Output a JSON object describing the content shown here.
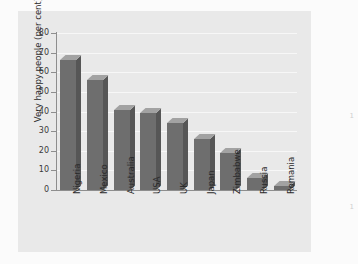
{
  "chart_data": {
    "type": "bar",
    "title": "",
    "subtitle": "",
    "xlabel": "",
    "ylabel": "Very happy people (per cent)",
    "categories": [
      "Nigeria",
      "Mexico",
      "Australia",
      "USA",
      "UK",
      "Japan",
      "Zimbabwe",
      "Russia",
      "Romania"
    ],
    "values": [
      66,
      56,
      41,
      39,
      34,
      26,
      19,
      6,
      2
    ],
    "ylim": [
      0,
      80
    ],
    "ytick_labels": [
      "80",
      "70",
      "60",
      "50",
      "40",
      "30",
      "20",
      "10",
      "0"
    ],
    "ytick_values": [
      80,
      70,
      60,
      50,
      40,
      30,
      20,
      10,
      0
    ],
    "grid": true,
    "legend": "none",
    "orientation": "vertical",
    "bar_style": "3d",
    "colors": {
      "bar_front": "#6e6e6e",
      "bar_top": "#a2a2a2",
      "bar_side": "#565656",
      "panel_background": "#e9e9e9",
      "gridline": "#f7f7f7",
      "axis": "#8e8e8e",
      "text": "#2b2b2b",
      "page_background": "#fbfbfb"
    }
  },
  "page_margin_marks": {
    "top": "1",
    "bottom": "1"
  }
}
